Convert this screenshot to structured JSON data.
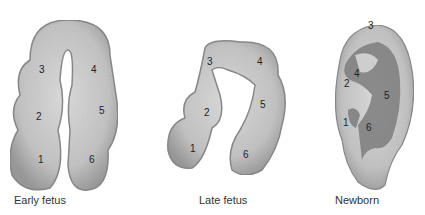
{
  "figure": {
    "panels": [
      {
        "id": "early-fetus",
        "caption": "Early fetus",
        "hillocks": [
          "1",
          "2",
          "3",
          "4",
          "5",
          "6"
        ]
      },
      {
        "id": "late-fetus",
        "caption": "Late fetus",
        "hillocks": [
          "1",
          "2",
          "3",
          "4",
          "5",
          "6"
        ]
      },
      {
        "id": "newborn",
        "caption": "Newborn",
        "hillocks": [
          "1",
          "2",
          "3",
          "4",
          "5",
          "6"
        ]
      }
    ],
    "colors": {
      "fill": "#c9c9c9",
      "shade": "#8f8f8f",
      "dark": "#6a6a6a",
      "text": "#333333"
    }
  }
}
